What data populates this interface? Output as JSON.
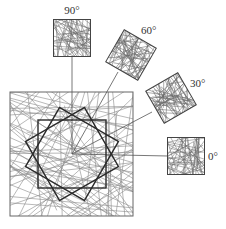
{
  "diagram": {
    "title": "",
    "colors": {
      "line": "#555555",
      "fiber": "#8a8a8a",
      "bold": "#2a2a2a",
      "background": "#ffffff"
    },
    "center": {
      "x": 72,
      "y": 154
    },
    "main_square": {
      "x": 10,
      "y": 92,
      "size": 123
    },
    "inner_squares_rotation_deg": [
      0,
      30,
      60
    ],
    "inner_square_size": 68,
    "samples": [
      {
        "label": "90°",
        "angle": 90,
        "cx": 72,
        "cy": 38,
        "size": 37,
        "rot": 0,
        "label_x": 72,
        "label_y": 14,
        "anchor": "middle",
        "link": [
          72,
          57
        ]
      },
      {
        "label": "60°",
        "angle": 60,
        "cx": 131,
        "cy": 55,
        "size": 37,
        "rot": 30,
        "label_x": 141,
        "label_y": 34,
        "anchor": "start",
        "link": [
          118,
          72
        ]
      },
      {
        "label": "30°",
        "angle": 30,
        "cx": 171,
        "cy": 98,
        "size": 37,
        "rot": -30,
        "label_x": 190,
        "label_y": 87,
        "anchor": "start",
        "link": [
          152,
          112
        ]
      },
      {
        "label": "0°",
        "angle": 0,
        "cx": 186,
        "cy": 156,
        "size": 37,
        "rot": 0,
        "label_x": 208,
        "label_y": 160,
        "anchor": "start",
        "link": [
          168,
          156
        ]
      }
    ]
  }
}
